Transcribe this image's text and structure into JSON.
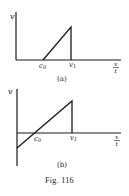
{
  "figure": {
    "caption": "Fig. 116",
    "panels": [
      {
        "id": "a",
        "label": "(a)",
        "y_axis_label": "v",
        "x_axis_label_num": "x",
        "x_axis_label_den": "t",
        "tick_c0": "c",
        "tick_c0_sub": "0",
        "tick_v1": "v",
        "tick_v1_sub": "1",
        "description": "Velocity zero for x/t < c0, rises linearly from c0 to v1, then drops vertically to zero at v1"
      },
      {
        "id": "b",
        "label": "(b)",
        "y_axis_label": "v",
        "x_axis_label_num": "x",
        "x_axis_label_den": "t",
        "tick_c0": "c",
        "tick_c0_sub": "0",
        "tick_v1": "v",
        "tick_v1_sub": "1",
        "description": "Velocity rises linearly from negative at origin, crosses zero at c0, reaches max at v1, then drops vertically to zero"
      }
    ]
  },
  "colors": {
    "ink": "#1a1a1a",
    "background": "#ffffff"
  }
}
